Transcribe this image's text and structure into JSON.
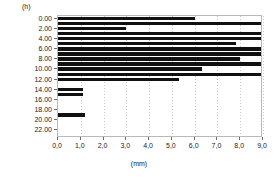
{
  "chart_data": {
    "type": "bar",
    "orientation": "horizontal",
    "title": "",
    "xlabel": "(mm)",
    "ylabel": "(h)",
    "xlim": [
      0.0,
      9.0
    ],
    "ylim": [
      0,
      23
    ],
    "grid": "vertical-dotted",
    "legend": "none",
    "bar_color": "#111111",
    "frame_color": "#b9b9b9",
    "x_ticks": [
      {
        "value": 0.0,
        "label": "0,0"
      },
      {
        "value": 1.0,
        "label": "1,0"
      },
      {
        "value": 2.0,
        "label": "2,0"
      },
      {
        "value": 3.0,
        "label": "3,0"
      },
      {
        "value": 4.0,
        "label": "4,0"
      },
      {
        "value": 5.0,
        "label": "5,0"
      },
      {
        "value": 6.0,
        "label": "6,0"
      },
      {
        "value": 7.0,
        "label": "7,0"
      },
      {
        "value": 8.0,
        "label": "8,0"
      },
      {
        "value": 9.0,
        "label": "9,0"
      }
    ],
    "y_ticks": [
      {
        "value": 0,
        "label": "0.00"
      },
      {
        "value": 2,
        "label": "2.00"
      },
      {
        "value": 4,
        "label": "4.00"
      },
      {
        "value": 6,
        "label": "6.00"
      },
      {
        "value": 8,
        "label": "8.00"
      },
      {
        "value": 10,
        "label": "10.00"
      },
      {
        "value": 12,
        "label": "12.00"
      },
      {
        "value": 14,
        "label": "14.00"
      },
      {
        "value": 16,
        "label": "16.00"
      },
      {
        "value": 18,
        "label": "18.00"
      },
      {
        "value": 20,
        "label": "20.00"
      },
      {
        "value": 22,
        "label": "22.00"
      }
    ],
    "categories": [
      "0.00",
      "1.00",
      "2.00",
      "3.00",
      "4.00",
      "5.00",
      "6.00",
      "7.00",
      "8.00",
      "9.00",
      "10.00",
      "11.00",
      "12.00",
      "13.00",
      "14.00",
      "15.00",
      "16.00",
      "17.00",
      "18.00",
      "19.00",
      "20.00",
      "21.00",
      "22.00",
      "23.00"
    ],
    "values": [
      6.0,
      8.9,
      3.0,
      8.9,
      8.9,
      7.8,
      8.9,
      8.9,
      8.0,
      8.9,
      6.3,
      8.9,
      5.3,
      0.0,
      1.1,
      1.1,
      0.0,
      0.0,
      0.0,
      1.2,
      0.0,
      0.0,
      0.0,
      0.0
    ]
  }
}
